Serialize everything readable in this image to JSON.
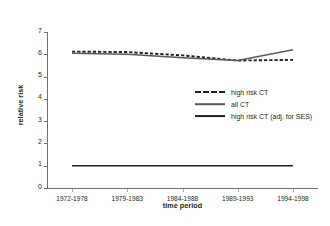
{
  "chart_data": {
    "type": "line",
    "title": "",
    "xlabel": "time period",
    "ylabel": "relative risk",
    "categories": [
      "1972-1978",
      "1979-1983",
      "1984-1988",
      "1989-1993",
      "1994-1998"
    ],
    "ylim": [
      0,
      7
    ],
    "yticks": [
      0,
      1,
      2,
      3,
      4,
      5,
      6,
      7
    ],
    "grid": false,
    "legend_position": "center-right",
    "series": [
      {
        "name": "high risk CT",
        "style": "dashed",
        "color": "#231f20",
        "values": [
          6.12,
          6.1,
          5.95,
          5.72,
          5.75
        ]
      },
      {
        "name": "all CT",
        "style": "solid",
        "color": "#58595b",
        "values": [
          6.05,
          6.0,
          5.85,
          5.72,
          6.2
        ]
      },
      {
        "name": "high risk CT (adj. for SES)",
        "style": "solid",
        "color": "#231f20",
        "values": [
          1.0,
          1.0,
          1.0,
          1.0,
          1.0
        ]
      }
    ]
  },
  "axes": {
    "y_title": "relative risk",
    "x_title": "time period",
    "y_tick_labels": [
      "0",
      "1",
      "2",
      "3",
      "4",
      "5",
      "6",
      "7"
    ],
    "x_tick_labels": [
      "1972-1978",
      "1979-1983",
      "1984-1988",
      "1989-1993",
      "1994-1998"
    ]
  },
  "legend": {
    "items": [
      {
        "label": "high risk CT",
        "style": "dashed"
      },
      {
        "label": "all CT",
        "style": "solid-gray"
      },
      {
        "label": "high risk CT (adj. for SES)",
        "style": "solid-dark"
      }
    ]
  }
}
